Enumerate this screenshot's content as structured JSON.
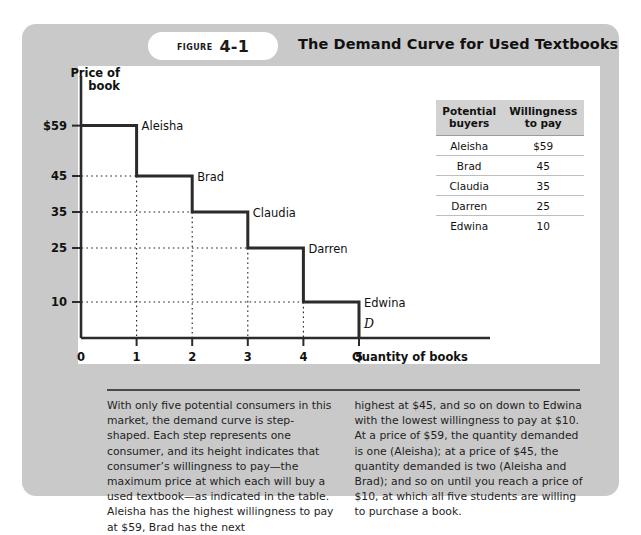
{
  "figure": {
    "tab_word": "Figure",
    "tab_number": "4-1",
    "title": "The Demand Curve for Used Textbooks"
  },
  "chart_data": {
    "type": "line",
    "title": "The Demand Curve for Used Textbooks",
    "xlabel": "Quantity of books",
    "ylabel": "Price of book",
    "ylabel_line1": "Price of",
    "ylabel_line2": "book",
    "xlim": [
      0,
      5
    ],
    "ylim": [
      0,
      70
    ],
    "grid": "dotted-guides",
    "curve_label": "D",
    "x_ticks": [
      "0",
      "1",
      "2",
      "3",
      "4",
      "5"
    ],
    "x_tick_values": [
      0,
      1,
      2,
      3,
      4,
      5
    ],
    "y_ticks": [
      "$59",
      "45",
      "35",
      "25",
      "10"
    ],
    "y_tick_values": [
      59,
      45,
      35,
      25,
      10
    ],
    "steps": [
      {
        "name": "Aleisha",
        "x_start": 0,
        "x_end": 1,
        "price": 59
      },
      {
        "name": "Brad",
        "x_start": 1,
        "x_end": 2,
        "price": 45
      },
      {
        "name": "Claudia",
        "x_start": 2,
        "x_end": 3,
        "price": 35
      },
      {
        "name": "Darren",
        "x_start": 3,
        "x_end": 4,
        "price": 25
      },
      {
        "name": "Edwina",
        "x_start": 4,
        "x_end": 5,
        "price": 10
      }
    ],
    "series": [
      {
        "name": "Demand",
        "categories": [
          "Aleisha",
          "Brad",
          "Claudia",
          "Darren",
          "Edwina"
        ],
        "values": [
          59,
          45,
          35,
          25,
          10
        ]
      }
    ]
  },
  "table": {
    "headers": [
      "Potential buyers",
      "Willingness to pay"
    ],
    "header_lines": [
      [
        "Potential",
        "buyers"
      ],
      [
        "Willingness",
        "to pay"
      ]
    ],
    "rows": [
      {
        "buyer": "Aleisha",
        "willingness": "$59"
      },
      {
        "buyer": "Brad",
        "willingness": "45"
      },
      {
        "buyer": "Claudia",
        "willingness": "35"
      },
      {
        "buyer": "Darren",
        "willingness": "25"
      },
      {
        "buyer": "Edwina",
        "willingness": "10"
      }
    ]
  },
  "caption": {
    "left": "With only five potential consumers in this market, the demand curve is step-shaped. Each step represents one consumer, and its height indicates that consumer’s willingness to pay—the maximum price at which each will buy a used textbook—as indicated in the table. Aleisha has the highest willingness to pay at $59, Brad has the next",
    "right": "highest at $45, and so on down to Edwina with the lowest willingness to pay at $10. At a price of $59, the quantity demanded is one (Aleisha); at a price of $45, the quantity demanded is two (Aleisha and Brad); and so on until you reach a price of $10, at which all five students are willing to purchase a book."
  },
  "colors": {
    "panel_background": "#c9c9c9",
    "chart_background": "#ffffff",
    "curve": "#2b2b2b",
    "axis": "#2b2b2b",
    "table_header_background": "#d2d2d2",
    "text": "#111111"
  }
}
